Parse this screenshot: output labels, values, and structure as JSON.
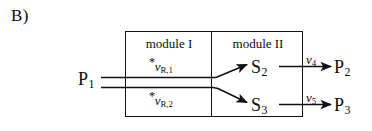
{
  "figure": {
    "panel_label": "B)",
    "modules": [
      {
        "id": "module-1",
        "label": "module I"
      },
      {
        "id": "module-2",
        "label": "module II"
      }
    ],
    "nodes": [
      {
        "id": "p1",
        "base": "P",
        "sub": "1"
      },
      {
        "id": "s2",
        "base": "S",
        "sub": "2"
      },
      {
        "id": "s3",
        "base": "S",
        "sub": "3"
      },
      {
        "id": "p2",
        "base": "P",
        "sub": "2"
      },
      {
        "id": "p3",
        "base": "P",
        "sub": "3"
      }
    ],
    "rate_labels": [
      {
        "id": "vR1",
        "star": "*",
        "symbol": "v",
        "sub": "R,1"
      },
      {
        "id": "vR2",
        "star": "*",
        "symbol": "v",
        "sub": "R,2"
      },
      {
        "id": "v4",
        "star": "",
        "symbol": "v",
        "sub": "4"
      },
      {
        "id": "v5",
        "star": "",
        "symbol": "v",
        "sub": "5"
      }
    ],
    "colors": {
      "ink": "#111111",
      "background": "#ffffff"
    }
  }
}
